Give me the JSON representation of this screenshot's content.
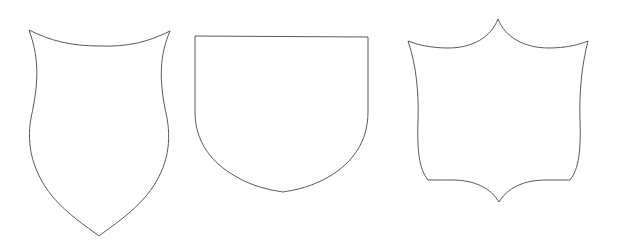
{
  "canvas": {
    "width": 630,
    "height": 243,
    "background_color": "#ffffff",
    "stroke_color": "#595959",
    "stroke_width": 1,
    "fill_color": "#ffffff"
  },
  "figure": {
    "type": "line-drawing",
    "shape_count": 3
  },
  "shapes": [
    {
      "name": "shield-pointed-flared",
      "description": "Pointed heraldic shield with concave flared top edge, outward-bowed upper flanks, tapering to a sharp point at the bottom",
      "bbox": {
        "x": 28,
        "y": 29,
        "width": 144,
        "height": 208
      },
      "key_points": {
        "top_left_horn": [
          29,
          30
        ],
        "top_right_horn": [
          170,
          31
        ],
        "top_center_dip": [
          100,
          45
        ],
        "left_widest": [
          28,
          140
        ],
        "right_widest": [
          171,
          140
        ],
        "bottom_point": [
          99,
          236
        ]
      },
      "path": "M 29 30 C 38 55 40 78 31 118 C 26 146 33 172 52 196 C 68 215 86 226 99 236 C 112 226 131 214 147 195 C 166 171 172 146 167 118 C 158 78 160 55 170 31 C 148 42 128 47 100 46 C 71 46 51 41 29 30 Z"
    },
    {
      "name": "shield-flat-top-rounded",
      "description": "Shield with a straight horizontal top edge, straight vertical upper sides, rounded lower corners and a shallow central point at the bottom",
      "bbox": {
        "x": 194,
        "y": 36,
        "width": 175,
        "height": 157
      },
      "key_points": {
        "top_left_corner": [
          195,
          36
        ],
        "top_right_corner": [
          368,
          37
        ],
        "left_side_at_curve_start": [
          195,
          110
        ],
        "right_side_at_curve_start": [
          368,
          111
        ],
        "bottom_point": [
          283,
          192
        ]
      },
      "path": "M 195 36 L 368 37 L 368 112 C 368 142 352 163 330 176 C 312 187 295 190 283 192 C 271 190 253 187 235 176 C 212 163 195 142 195 112 Z"
    },
    {
      "name": "shield-ogee-cusped",
      "description": "Broad ogee shield with a central spike at the top, two concave shoulder sweeps, bulging sides and a cusped central point at the bottom",
      "bbox": {
        "x": 399,
        "y": 18,
        "width": 191,
        "height": 185
      },
      "key_points": {
        "top_center_spike": [
          498,
          19
        ],
        "top_left_horn": [
          408,
          41
        ],
        "top_right_horn": [
          588,
          41
        ],
        "left_widest": [
          400,
          122
        ],
        "right_widest": [
          589,
          122
        ],
        "bottom_center_cusp": [
          499,
          202
        ],
        "bottom_left_shoulder": [
          440,
          180
        ],
        "bottom_right_shoulder": [
          558,
          180
        ]
      },
      "path": "M 498 19 C 505 37 524 48 549 48 C 565 48 578 45 588 41 C 582 64 579 92 580 120 C 581 150 579 169 570 180 C 563 180 553 180 545 180 C 524 180 507 188 499 202 C 491 188 474 180 453 180 C 445 180 435 180 428 180 C 419 169 417 150 418 120 C 419 92 416 64 408 41 C 418 45 432 48 448 48 C 473 48 491 37 498 19 Z"
    }
  ]
}
